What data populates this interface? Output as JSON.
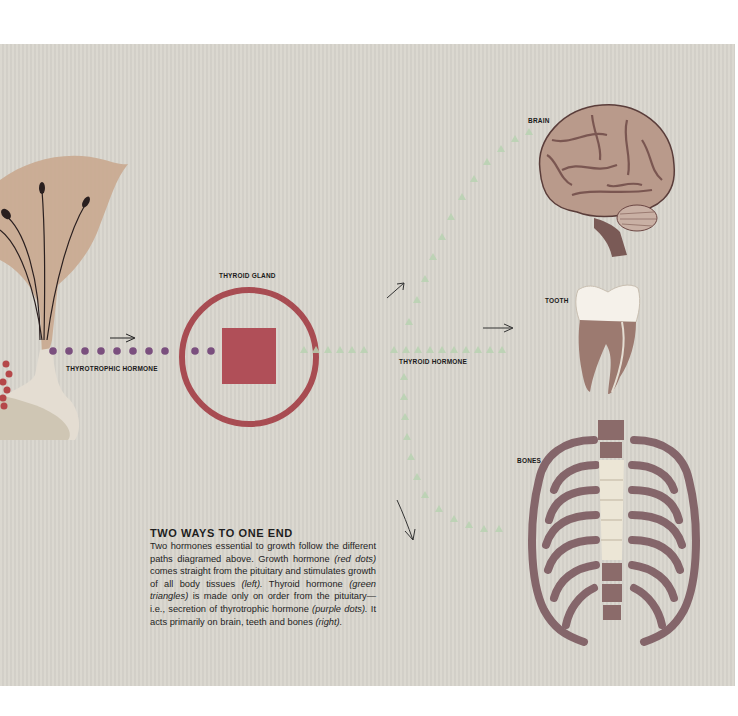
{
  "labels": {
    "brain": "BRAIN",
    "thyroid_gland": "THYROID GLAND",
    "tooth": "TOOTH",
    "thyrotrophic_hormone": "THYROTROPHIC HORMONE",
    "thyroid_hormone": "THYROID HORMONE",
    "bones": "BONES"
  },
  "caption": {
    "title": "TWO WAYS TO ONE END",
    "segments": [
      {
        "text": "Two hormones essential to growth follow the different paths diagramed above. Growth hormone ",
        "italic": false
      },
      {
        "text": "(red dots)",
        "italic": true
      },
      {
        "text": " comes straight from the pituitary and stimulates growth of all body tissues ",
        "italic": false
      },
      {
        "text": "(left).",
        "italic": true
      },
      {
        "text": " Thyroid hormone ",
        "italic": false
      },
      {
        "text": "(green triangles)",
        "italic": true
      },
      {
        "text": " is made only on order from the pituitary—i.e., secretion of thyrotrophic hormone ",
        "italic": false
      },
      {
        "text": "(purple dots).",
        "italic": true
      },
      {
        "text": " It acts primarily on brain, teeth and bones ",
        "italic": false
      },
      {
        "text": "(right).",
        "italic": true
      }
    ]
  },
  "colors": {
    "background": "#d9d6ce",
    "purple_dots": "#7a4f7e",
    "red_dots": "#b5484a",
    "green_triangles": "#b9d3b2",
    "thyroid_ring": "#a84c52",
    "thyroid_square": "#b04f58",
    "pituitary_lobe": "#c7a88f",
    "brain": "#b79a8c",
    "tooth_crown": "#f5f1ea",
    "tooth_root": "#9c7a70",
    "ribs": "#7c5a60",
    "spine": "#ece6d6"
  },
  "icons": [
    "pituitary-gland-illustration",
    "thyroid-gland-icon",
    "brain-illustration",
    "tooth-illustration",
    "ribcage-illustration",
    "arrow-icon"
  ]
}
